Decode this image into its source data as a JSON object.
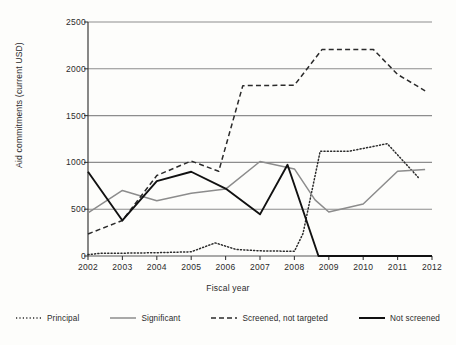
{
  "chart_data": {
    "type": "line",
    "title": "",
    "xlabel": "Fiscal year",
    "ylabel": "Aid commitments (current USD)",
    "xlim": [
      2002,
      2012
    ],
    "ylim": [
      0,
      2500
    ],
    "yticks": [
      0,
      500,
      1000,
      1500,
      2000,
      2500
    ],
    "xticks": [
      2002,
      2003,
      2004,
      2005,
      2006,
      2007,
      2008,
      2009,
      2010,
      2011,
      2012
    ],
    "grid": "horizontal",
    "legend_position": "bottom",
    "series": [
      {
        "name": "Principal",
        "style": "dotted",
        "color": "#2b2b2b",
        "x": [
          2002,
          2002.4,
          2003,
          2004,
          2005,
          2005.7,
          2006.3,
          2007,
          2008,
          2008.25,
          2008.75,
          2009.6,
          2010.7,
          2011.6
        ],
        "values": [
          15,
          30,
          30,
          35,
          45,
          140,
          70,
          55,
          50,
          240,
          1120,
          1120,
          1200,
          840
        ]
      },
      {
        "name": "Significant",
        "style": "solid",
        "color": "#8c8c8c",
        "x": [
          2002,
          2003,
          2004,
          2005,
          2006,
          2007,
          2008,
          2008.6,
          2009,
          2010,
          2011,
          2011.8
        ],
        "values": [
          460,
          700,
          590,
          670,
          715,
          1010,
          930,
          600,
          470,
          555,
          905,
          925
        ]
      },
      {
        "name": "Screened, not targeted",
        "style": "dashed",
        "color": "#2b2b2b",
        "x": [
          2002,
          2003,
          2004,
          2005,
          2005.8,
          2006.5,
          2008,
          2008.8,
          2010.3,
          2011,
          2011.8
        ],
        "values": [
          235,
          380,
          860,
          1015,
          905,
          1820,
          1825,
          2205,
          2205,
          1940,
          1765
        ]
      },
      {
        "name": "Not screened",
        "style": "solid-bold",
        "color": "#111111",
        "x": [
          2002,
          2003,
          2004,
          2005,
          2006,
          2007,
          2007.8,
          2008.7,
          2009,
          2010,
          2011,
          2012
        ],
        "values": [
          900,
          380,
          800,
          900,
          720,
          445,
          975,
          0,
          0,
          0,
          0,
          0
        ]
      }
    ]
  },
  "axis": {
    "y_label": "Aid commitments (current USD)",
    "x_label": "Fiscal year",
    "y_tick_labels": [
      "2500",
      "2000",
      "1500",
      "1000",
      "500",
      "0"
    ],
    "x_tick_labels": [
      "2002",
      "2003",
      "2004",
      "2005",
      "2006",
      "2007",
      "2008",
      "2009",
      "2010",
      "2011",
      "2012"
    ]
  },
  "legend": {
    "items": [
      {
        "label": "Principal",
        "style": "dotted"
      },
      {
        "label": "Significant",
        "style": "solid-gray"
      },
      {
        "label": "Screened, not targeted",
        "style": "dashed"
      },
      {
        "label": "Not screened",
        "style": "solid-black"
      }
    ]
  }
}
